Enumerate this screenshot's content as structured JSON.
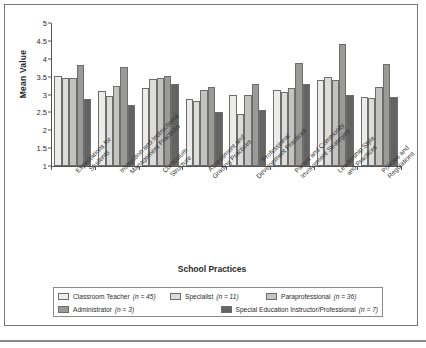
{
  "chart_data": {
    "type": "bar",
    "title": "",
    "xlabel": "School Practices",
    "ylabel": "Mean Value",
    "ylim": [
      1,
      5
    ],
    "yticks": [
      1,
      1.5,
      2,
      2.5,
      3,
      3.5,
      4,
      4.5,
      5
    ],
    "ytick_labels": [
      "1",
      "1.5",
      "2",
      "2.5",
      "3",
      "3.5",
      "4",
      "4.5",
      "5"
    ],
    "grid": false,
    "legend_position": "bottom",
    "categories": [
      "Expectations for Students",
      "Instruction and Instructional Management Practices",
      "Curriculum Structure",
      "Assessment and Grading Practices",
      "Professional Development Practices",
      "Parent and Community Involvement Strategies",
      "Leadership Style and Practices",
      "Policies and Regulations"
    ],
    "category_lines": [
      [
        "Expectations for",
        "Students"
      ],
      [
        "Instruction and Instructional",
        "Management Practices"
      ],
      [
        "Curriculum",
        "Structure"
      ],
      [
        "Assessment and",
        "Grading Practices"
      ],
      [
        "Professional",
        "Development Practices"
      ],
      [
        "Parent and Community",
        "Involvement Strategies"
      ],
      [
        "Leadership Style",
        "and Practices"
      ],
      [
        "Policies and",
        "Regulations"
      ]
    ],
    "series": [
      {
        "name": "Classroom Teacher",
        "n": 45,
        "color": "#ececeb",
        "values": [
          3.52,
          3.1,
          3.18,
          2.88,
          3.0,
          3.13,
          3.4,
          2.93
        ]
      },
      {
        "name": "Specialist",
        "n": 11,
        "color": "#dcdcda",
        "values": [
          3.45,
          2.96,
          3.43,
          2.82,
          2.45,
          3.06,
          3.48,
          2.89
        ]
      },
      {
        "name": "Paraprofessional",
        "n": 36,
        "color": "#c3c3c1",
        "values": [
          3.45,
          3.23,
          3.45,
          3.12,
          3.0,
          3.17,
          3.42,
          3.2
        ]
      },
      {
        "name": "Administrator",
        "n": 3,
        "color": "#9a9a99",
        "values": [
          3.82,
          3.76,
          3.52,
          3.2,
          3.3,
          3.88,
          4.42,
          3.85
        ]
      },
      {
        "name": "Special Education Instructor/Professional",
        "n": 7,
        "color": "#636363",
        "values": [
          2.88,
          2.71,
          3.3,
          2.5,
          2.57,
          3.3,
          3.0,
          2.93
        ]
      }
    ],
    "legend": [
      {
        "label": "Classroom Teacher",
        "n_text": "(n = 45)",
        "color": "#ececeb"
      },
      {
        "label": "Specialist",
        "n_text": "(n = 11)",
        "color": "#dcdcda"
      },
      {
        "label": "Paraprofessional",
        "n_text": "(n = 36)",
        "color": "#c3c3c1"
      },
      {
        "label": "Administrator",
        "n_text": "(n = 3)",
        "color": "#9a9a99"
      },
      {
        "label": "Special Education Instructor/Professional",
        "n_text": "(n = 7)",
        "color": "#636363"
      }
    ]
  }
}
